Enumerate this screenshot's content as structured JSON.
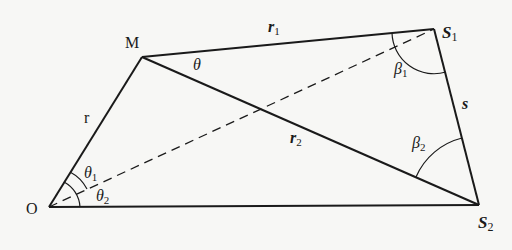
{
  "diagram": {
    "points": {
      "O": {
        "label": "O",
        "x": 49,
        "y": 207
      },
      "M": {
        "label": "M",
        "x": 142,
        "y": 57
      },
      "S1": {
        "label": "S",
        "sub": "1",
        "x": 434,
        "y": 29
      },
      "S2": {
        "label": "S",
        "sub": "2",
        "x": 479,
        "y": 205
      }
    },
    "edges": [
      {
        "from": "O",
        "to": "M",
        "label": "r",
        "style": "solid"
      },
      {
        "from": "M",
        "to": "S1",
        "label": "r",
        "sub": "1",
        "style": "solid"
      },
      {
        "from": "M",
        "to": "S2",
        "label": "r",
        "sub": "2",
        "style": "solid"
      },
      {
        "from": "S1",
        "to": "S2",
        "label": "s",
        "style": "solid"
      },
      {
        "from": "O",
        "to": "S2",
        "label": "",
        "style": "solid"
      },
      {
        "from": "O",
        "to": "S1",
        "label": "",
        "style": "dashed"
      }
    ],
    "angles": {
      "theta": {
        "label": "θ"
      },
      "theta1": {
        "label": "θ",
        "sub": "1"
      },
      "theta2": {
        "label": "θ",
        "sub": "2"
      },
      "beta1": {
        "label": "β",
        "sub": "1"
      },
      "beta2": {
        "label": "β",
        "sub": "2"
      }
    },
    "colors": {
      "line": "#1a1a1a",
      "background": "#f7f7f5"
    }
  }
}
